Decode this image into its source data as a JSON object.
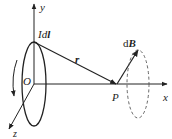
{
  "diagram": {
    "labels": {
      "y_axis": "y",
      "x_axis": "x",
      "z_axis": "z",
      "origin": "O",
      "point": "P",
      "current_element_prefix": "Id",
      "current_element_vec": "l",
      "radius_vector": "r",
      "field_prefix": "d",
      "field_vec": "B"
    },
    "colors": {
      "ink": "#222222",
      "dashed": "#555555",
      "background": "#ffffff"
    }
  }
}
